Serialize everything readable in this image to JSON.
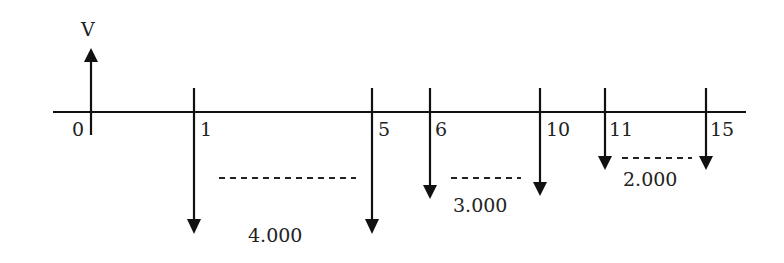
{
  "diagram": {
    "type": "cash-flow timeline",
    "top_label": "V",
    "ticks": [
      "0",
      "1",
      "5",
      "6",
      "10",
      "11",
      "15"
    ],
    "groups": [
      {
        "from": "1",
        "to": "5",
        "amount": "4.000"
      },
      {
        "from": "6",
        "to": "10",
        "amount": "3.000"
      },
      {
        "from": "11",
        "to": "15",
        "amount": "2.000"
      }
    ]
  }
}
